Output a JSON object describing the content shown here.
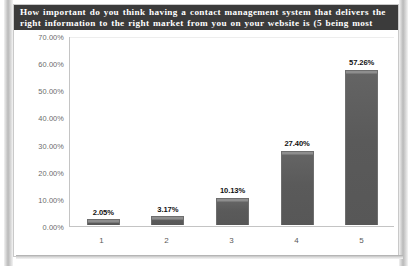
{
  "title": "How important do you think having a contact management system that delivers the right information to the right market from you on your website is (5 being most important)?",
  "chart_data": {
    "type": "bar",
    "title": "How important do you think having a contact management system that delivers the right information to the right market from you on your website is (5 being most important)?",
    "categories": [
      "1",
      "2",
      "3",
      "4",
      "5"
    ],
    "values": [
      2.05,
      3.17,
      10.13,
      27.4,
      57.26
    ],
    "value_labels": [
      "2.05%",
      "3.17%",
      "10.13%",
      "27.40%",
      "57.26%"
    ],
    "xlabel": "",
    "ylabel": "",
    "ylim": [
      0,
      70
    ],
    "ytick_labels": [
      "0.00%",
      "10.00%",
      "20.00%",
      "30.00%",
      "40.00%",
      "50.00%",
      "60.00%",
      "70.00%"
    ],
    "ytick_values": [
      0,
      10,
      20,
      30,
      40,
      50,
      60,
      70
    ],
    "grid": false,
    "legend": false,
    "bar_color": "#585858",
    "title_background": "#3b3b3b",
    "title_color": "#ffffff",
    "axis_color": "#c4c4c4",
    "tick_label_color": "#6b6b6b"
  }
}
